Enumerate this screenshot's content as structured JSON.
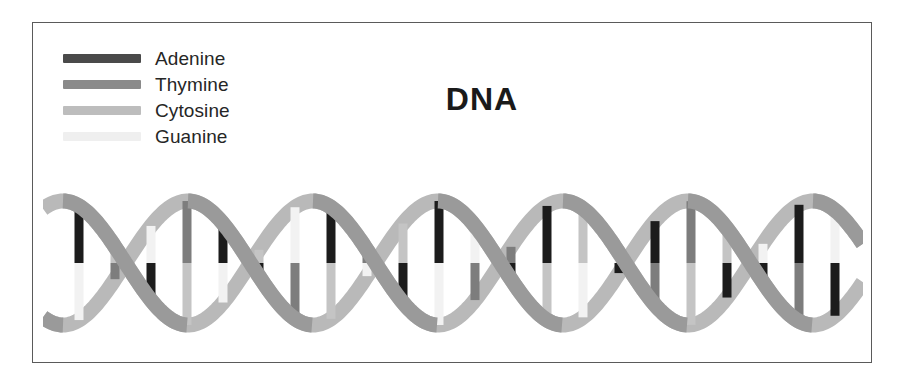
{
  "figure": {
    "title": "DNA",
    "border_color": "#5a5a5a",
    "background": "#ffffff"
  },
  "legend": {
    "items": [
      {
        "label": "Adenine",
        "color": "#4a4a4a"
      },
      {
        "label": "Thymine",
        "color": "#8a8a8a"
      },
      {
        "label": "Cytosine",
        "color": "#bdbdbd"
      },
      {
        "label": "Guanine",
        "color": "#efefef"
      }
    ]
  },
  "helix": {
    "backbone_front_color": "#9a9a9a",
    "backbone_back_color": "#b9b9b9",
    "backbone_width": 15,
    "amplitude": 62,
    "period": 250,
    "phase": 20,
    "baseline": 90,
    "rung_width": 9,
    "rung_start_x": 36,
    "rung_spacing": 36,
    "colors": {
      "adenine": "#1c1c1c",
      "thymine": "#7d7d7d",
      "cytosine": "#c4c4c4",
      "guanine": "#f2f2f2"
    },
    "rungs": [
      {
        "x": 36,
        "top": "adenine",
        "bottom": "guanine"
      },
      {
        "x": 72,
        "top": "cytosine",
        "bottom": "thymine"
      },
      {
        "x": 108,
        "top": "guanine",
        "bottom": "adenine"
      },
      {
        "x": 144,
        "top": "thymine",
        "bottom": "cytosine"
      },
      {
        "x": 180,
        "top": "adenine",
        "bottom": "guanine"
      },
      {
        "x": 216,
        "top": "cytosine",
        "bottom": "adenine"
      },
      {
        "x": 252,
        "top": "guanine",
        "bottom": "thymine"
      },
      {
        "x": 288,
        "top": "adenine",
        "bottom": "cytosine"
      },
      {
        "x": 324,
        "top": "thymine",
        "bottom": "guanine"
      },
      {
        "x": 360,
        "top": "cytosine",
        "bottom": "adenine"
      },
      {
        "x": 396,
        "top": "adenine",
        "bottom": "guanine"
      },
      {
        "x": 432,
        "top": "guanine",
        "bottom": "thymine"
      },
      {
        "x": 468,
        "top": "thymine",
        "bottom": "adenine"
      },
      {
        "x": 504,
        "top": "adenine",
        "bottom": "cytosine"
      },
      {
        "x": 540,
        "top": "cytosine",
        "bottom": "guanine"
      },
      {
        "x": 576,
        "top": "guanine",
        "bottom": "adenine"
      },
      {
        "x": 612,
        "top": "adenine",
        "bottom": "thymine"
      },
      {
        "x": 648,
        "top": "thymine",
        "bottom": "cytosine"
      },
      {
        "x": 684,
        "top": "cytosine",
        "bottom": "adenine"
      },
      {
        "x": 720,
        "top": "guanine",
        "bottom": "adenine"
      },
      {
        "x": 756,
        "top": "adenine",
        "bottom": "thymine"
      },
      {
        "x": 792,
        "top": "guanine",
        "bottom": "adenine"
      }
    ]
  }
}
